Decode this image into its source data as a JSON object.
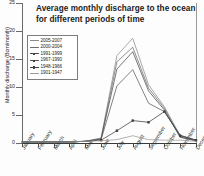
{
  "chart_data": {
    "type": "line",
    "title": "Average monthly discharge to the ocean for different periods of time",
    "title_line1": "Average monthly discharge to the ocean",
    "title_line2": "for different periods of time",
    "xlabel": "",
    "ylabel": "Monthly discharge (Bcm/month)",
    "ylim": [
      0,
      25
    ],
    "yticks": [
      0,
      5,
      10,
      15,
      20,
      25
    ],
    "ytick_labels": [
      "0",
      "5",
      "10",
      "15",
      "20",
      "25"
    ],
    "grid": false,
    "legend_position": "upper-left-inside",
    "categories": [
      "January",
      "February",
      "March",
      "April",
      "May",
      "June",
      "July",
      "August",
      "September",
      "October",
      "November",
      "December"
    ],
    "series": [
      {
        "name": "2005-2007",
        "color": "#8c8c8c",
        "values": [
          0.2,
          0.2,
          0.2,
          0.2,
          0.3,
          0.9,
          15.6,
          18.7,
          10.4,
          6.5,
          1.3,
          0.5
        ]
      },
      {
        "name": "2000-2004",
        "color": "#6e6e6e",
        "values": [
          0.2,
          0.2,
          0.2,
          0.2,
          0.3,
          0.8,
          14.5,
          17.1,
          9.8,
          6.2,
          1.1,
          0.4
        ]
      },
      {
        "name": "1991-1999",
        "color": "#4a4a4a",
        "values": [
          0.2,
          0.2,
          0.2,
          0.2,
          0.3,
          0.7,
          13.2,
          16.3,
          9.3,
          5.9,
          1.0,
          0.4
        ]
      },
      {
        "name": "1967-1990",
        "color": "#5a5a5a",
        "values": [
          0.2,
          0.2,
          0.2,
          0.2,
          0.3,
          0.6,
          10.2,
          13.1,
          7.1,
          5.6,
          1.4,
          0.5
        ]
      },
      {
        "name": "1948-1966",
        "color": "#3d3d3d",
        "values": [
          0.2,
          0.2,
          0.2,
          0.2,
          0.3,
          0.5,
          2.2,
          4.0,
          3.7,
          5.6,
          1.3,
          0.5
        ]
      },
      {
        "name": "1901-1947",
        "color": "#9b9b9b",
        "values": [
          0.2,
          0.2,
          0.2,
          0.2,
          0.3,
          0.4,
          0.6,
          1.3,
          0.6,
          0.5,
          0.5,
          0.3
        ]
      }
    ]
  },
  "legend": {
    "items": [
      {
        "label": "2005-2007",
        "marker": false
      },
      {
        "label": "2000-2004",
        "marker": false
      },
      {
        "label": "1991-1999",
        "marker": true
      },
      {
        "label": "1967-1990",
        "marker": true
      },
      {
        "label": "1948-1966",
        "marker": true
      },
      {
        "label": "1901-1947",
        "marker": false
      }
    ]
  }
}
